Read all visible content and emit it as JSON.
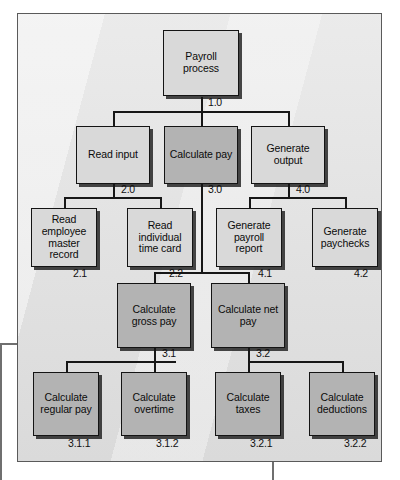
{
  "diagram": {
    "colors": {
      "frame_background": "#e2e2e2",
      "frame_border": "#5a5a5a",
      "node_light": "#d9d9d9",
      "node_dark": "#b3b3b3",
      "node_border": "#141414",
      "connector": "#171717"
    },
    "nodes": [
      {
        "id": "root",
        "label": "Payroll process",
        "ref": "1.0",
        "shade": "light",
        "level": 0
      },
      {
        "id": "n20",
        "label": "Read input",
        "ref": "2.0",
        "shade": "light",
        "level": 1
      },
      {
        "id": "n30",
        "label": "Calculate pay",
        "ref": "3.0",
        "shade": "dark",
        "level": 1
      },
      {
        "id": "n40",
        "label": "Generate output",
        "ref": "4.0",
        "shade": "light",
        "level": 1
      },
      {
        "id": "n21",
        "label": "Read employee master record",
        "ref": "2.1",
        "shade": "light",
        "level": 2
      },
      {
        "id": "n22",
        "label": "Read individual time card",
        "ref": "2.2",
        "shade": "light",
        "level": 2
      },
      {
        "id": "n41",
        "label": "Generate payroll report",
        "ref": "4.1",
        "shade": "light",
        "level": 2
      },
      {
        "id": "n42",
        "label": "Generate paychecks",
        "ref": "4.2",
        "shade": "light",
        "level": 2
      },
      {
        "id": "n31",
        "label": "Calculate gross pay",
        "ref": "3.1",
        "shade": "dark",
        "level": 3
      },
      {
        "id": "n32",
        "label": "Calculate net pay",
        "ref": "3.2",
        "shade": "dark",
        "level": 3
      },
      {
        "id": "n311",
        "label": "Calculate regular pay",
        "ref": "3.1.1",
        "shade": "dark",
        "level": 4
      },
      {
        "id": "n312",
        "label": "Calculate overtime",
        "ref": "3.1.2",
        "shade": "dark",
        "level": 4
      },
      {
        "id": "n321",
        "label": "Calculate taxes",
        "ref": "3.2.1",
        "shade": "dark",
        "level": 4
      },
      {
        "id": "n322",
        "label": "Calculate deductions",
        "ref": "3.2.2",
        "shade": "dark",
        "level": 4
      }
    ],
    "edges": [
      {
        "from": "root",
        "to": "n20"
      },
      {
        "from": "root",
        "to": "n30"
      },
      {
        "from": "root",
        "to": "n40"
      },
      {
        "from": "n20",
        "to": "n21"
      },
      {
        "from": "n20",
        "to": "n22"
      },
      {
        "from": "n40",
        "to": "n41"
      },
      {
        "from": "n40",
        "to": "n42"
      },
      {
        "from": "n30",
        "to": "n31"
      },
      {
        "from": "n30",
        "to": "n32"
      },
      {
        "from": "n31",
        "to": "n311"
      },
      {
        "from": "n31",
        "to": "n312"
      },
      {
        "from": "n32",
        "to": "n321"
      },
      {
        "from": "n32",
        "to": "n322"
      }
    ]
  }
}
